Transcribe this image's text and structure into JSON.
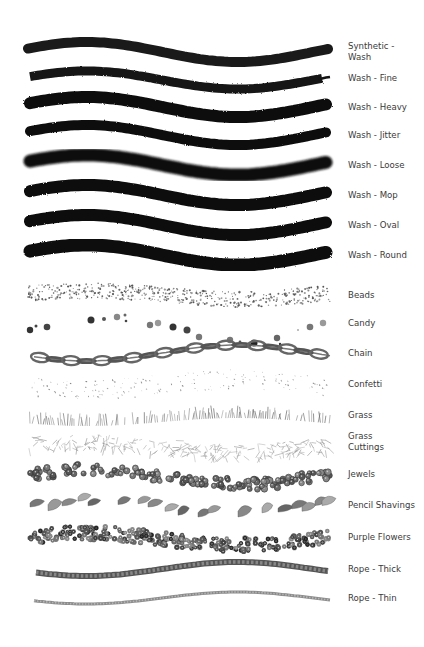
{
  "brushes": [
    {
      "label": "Synthetic -\nWash",
      "style": "wash-smooth",
      "y": 52
    },
    {
      "label": "Wash - Fine",
      "style": "wash-fine",
      "y": 78
    },
    {
      "label": "Wash - Heavy",
      "style": "wash-heavy",
      "y": 107
    },
    {
      "label": "Wash - Jitter",
      "style": "wash-jitter",
      "y": 135
    },
    {
      "label": "Wash - Loose",
      "style": "wash-loose",
      "y": 165
    },
    {
      "label": "Wash - Mop",
      "style": "wash-mop",
      "y": 195
    },
    {
      "label": "Wash - Oval",
      "style": "wash-oval",
      "y": 225
    },
    {
      "label": "Wash - Round",
      "style": "wash-round",
      "y": 255
    },
    {
      "label": "Beads",
      "style": "beads",
      "y": 295
    },
    {
      "label": "Candy",
      "style": "candy",
      "y": 323
    },
    {
      "label": "Chain",
      "style": "chain",
      "y": 353
    },
    {
      "label": "Confetti",
      "style": "confetti",
      "y": 384
    },
    {
      "label": "Grass",
      "style": "grass",
      "y": 415
    },
    {
      "label": "Grass\nCuttings",
      "style": "grass-cuttings",
      "y": 442
    },
    {
      "label": "Jewels",
      "style": "jewels",
      "y": 474
    },
    {
      "label": "Pencil Shavings",
      "style": "pencil-shavings",
      "y": 505
    },
    {
      "label": "Purple Flowers",
      "style": "purple-flowers",
      "y": 537
    },
    {
      "label": "Rope - Thick",
      "style": "rope-thick",
      "y": 569
    },
    {
      "label": "Rope - Thin",
      "style": "rope-thin",
      "y": 598
    }
  ],
  "colors": {
    "ink": "#111111",
    "label": "#3a3a3a",
    "background": "#ffffff"
  }
}
